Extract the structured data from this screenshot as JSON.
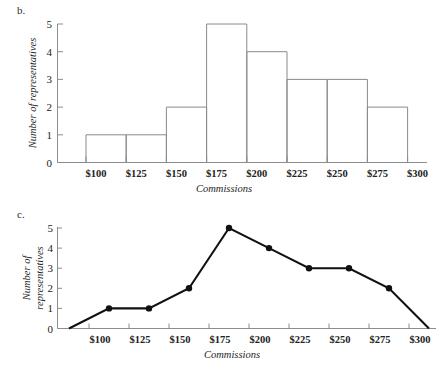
{
  "figure": {
    "panels": [
      {
        "letter": "b."
      },
      {
        "letter": "c."
      }
    ]
  },
  "chart_data": [
    {
      "panel": "b.",
      "type": "bar",
      "title": "",
      "xlabel": "Commissions",
      "ylabel": "Number of representatives",
      "xtick_labels": [
        "$100",
        "$125",
        "$150",
        "$175",
        "$200",
        "$225",
        "$250",
        "$275",
        "$300"
      ],
      "xtick_values": [
        100,
        125,
        150,
        175,
        200,
        225,
        250,
        275,
        300
      ],
      "ytick_labels": [
        "0",
        "1",
        "2",
        "3",
        "4",
        "5"
      ],
      "ylim": [
        0,
        5
      ],
      "xlim": [
        75,
        325
      ],
      "grid": false,
      "legend": false,
      "categories": [
        "$100-$125",
        "$125-$150",
        "$150-$175",
        "$175-$200",
        "$200-$225",
        "$225-$250",
        "$250-$275",
        "$275-$300"
      ],
      "bin_edges": [
        100,
        125,
        150,
        175,
        200,
        225,
        250,
        275,
        300
      ],
      "values": [
        1,
        1,
        2,
        5,
        4,
        3,
        3,
        2
      ],
      "bar_color": "#ffffff",
      "bar_edge_color": "#8a8a8a"
    },
    {
      "panel": "c.",
      "type": "line",
      "title": "",
      "xlabel": "Commissions",
      "ylabel": "Number of representatives",
      "xtick_labels": [
        "$100",
        "$125",
        "$150",
        "$175",
        "$200",
        "$225",
        "$250",
        "$275",
        "$300"
      ],
      "xtick_values": [
        100,
        125,
        150,
        175,
        200,
        225,
        250,
        275,
        300
      ],
      "ytick_labels": [
        "0",
        "1",
        "2",
        "3",
        "4",
        "5"
      ],
      "ylim": [
        0,
        5
      ],
      "xlim": [
        75,
        325
      ],
      "grid": false,
      "legend": false,
      "x": [
        87.5,
        112.5,
        137.5,
        162.5,
        187.5,
        212.5,
        237.5,
        262.5,
        287.5,
        312.5
      ],
      "values": [
        0,
        1,
        1,
        2,
        5,
        4,
        3,
        3,
        2,
        0
      ],
      "line_color": "#111111",
      "marker": "circle",
      "markers_shown_at": [
        112.5,
        137.5,
        162.5,
        187.5,
        212.5,
        237.5,
        262.5,
        287.5
      ]
    }
  ]
}
